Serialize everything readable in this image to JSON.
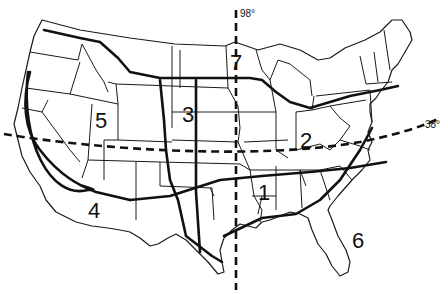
{
  "map": {
    "subject": "Contiguous United States divided into numbered regions",
    "reference_lines": {
      "meridian": {
        "label": "98°",
        "style": "dashed",
        "orientation": "vertical"
      },
      "parallel": {
        "label": "38°",
        "style": "dashed",
        "orientation": "horizontal"
      }
    },
    "regions": [
      {
        "id": "1",
        "label": "1"
      },
      {
        "id": "2",
        "label": "2"
      },
      {
        "id": "3",
        "label": "3"
      },
      {
        "id": "4",
        "label": "4"
      },
      {
        "id": "5",
        "label": "5"
      },
      {
        "id": "6",
        "label": "6"
      },
      {
        "id": "7",
        "label": "7"
      }
    ],
    "colors": {
      "ink": "#111111",
      "background": "#ffffff"
    }
  }
}
